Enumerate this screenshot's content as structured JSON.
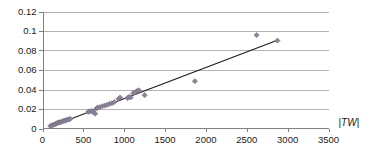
{
  "chart_data": {
    "type": "scatter",
    "title": "",
    "subtitle": "",
    "xlabel": "|TW|",
    "ylabel": "",
    "xlim": [
      0,
      3500
    ],
    "ylim": [
      0,
      0.12
    ],
    "xticks": [
      0,
      500,
      1000,
      1500,
      2000,
      2500,
      3000,
      3500
    ],
    "yticks": [
      0,
      0.02,
      0.04,
      0.06,
      0.08,
      0.1,
      0.12
    ],
    "xtick_labels": [
      "0",
      "500",
      "1000",
      "1500",
      "2000",
      "2500",
      "3000",
      "3500"
    ],
    "ytick_labels": [
      "0",
      "0.02",
      "0.04",
      "0.06",
      "0.08",
      "0.1",
      "0.12"
    ],
    "grid": "horizontal",
    "legend": "none",
    "marker_shape": "diamond",
    "marker_color": "#8e8499",
    "trendline_color": "#1a1a1a",
    "gridline_color": "#b3b3b3",
    "axis_color": "#808080",
    "series": [
      {
        "name": "observations",
        "marker": "diamond",
        "color": "#8e8499",
        "points": [
          [
            95,
            0.0025
          ],
          [
            110,
            0.003
          ],
          [
            125,
            0.0035
          ],
          [
            140,
            0.004
          ],
          [
            155,
            0.0045
          ],
          [
            165,
            0.005
          ],
          [
            180,
            0.0055
          ],
          [
            190,
            0.006
          ],
          [
            205,
            0.0065
          ],
          [
            220,
            0.0062
          ],
          [
            235,
            0.007
          ],
          [
            250,
            0.0075
          ],
          [
            265,
            0.008
          ],
          [
            280,
            0.0082
          ],
          [
            295,
            0.0088
          ],
          [
            310,
            0.009
          ],
          [
            325,
            0.0095
          ],
          [
            340,
            0.0098
          ],
          [
            560,
            0.0172
          ],
          [
            580,
            0.0175
          ],
          [
            600,
            0.018
          ],
          [
            620,
            0.0168
          ],
          [
            645,
            0.0152
          ],
          [
            660,
            0.0205
          ],
          [
            675,
            0.0215
          ],
          [
            700,
            0.022
          ],
          [
            730,
            0.0228
          ],
          [
            760,
            0.0235
          ],
          [
            790,
            0.0242
          ],
          [
            820,
            0.0252
          ],
          [
            850,
            0.026
          ],
          [
            880,
            0.0272
          ],
          [
            930,
            0.0305
          ],
          [
            950,
            0.0318
          ],
          [
            1040,
            0.0312
          ],
          [
            1060,
            0.0325
          ],
          [
            1080,
            0.0318
          ],
          [
            1110,
            0.0362
          ],
          [
            1135,
            0.0372
          ],
          [
            1160,
            0.0385
          ],
          [
            1180,
            0.0392
          ],
          [
            1250,
            0.0342
          ],
          [
            1865,
            0.0485
          ],
          [
            2620,
            0.0958
          ],
          [
            2875,
            0.0902
          ]
        ]
      }
    ],
    "trendline": {
      "name": "linear fit",
      "x_start": 95,
      "y_start": 0.0018,
      "x_end": 2875,
      "y_end": 0.0905
    }
  }
}
